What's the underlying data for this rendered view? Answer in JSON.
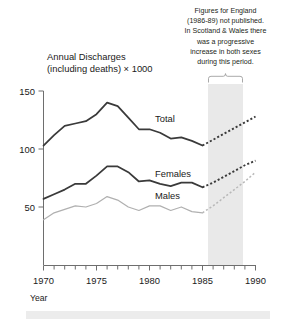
{
  "chart_data": {
    "type": "line",
    "title_line1": "Annual Discharges",
    "title_line2": "(including deaths) × 1000",
    "xlabel": "Year",
    "ylabel": "",
    "xlim": [
      1970,
      1990
    ],
    "ylim": [
      0,
      150
    ],
    "grid": false,
    "legend_position": "inline-labels",
    "x_ticks_major": [
      1970,
      1975,
      1980,
      1985,
      1990
    ],
    "x_ticks_major_labels": [
      "1970",
      "1975",
      "1980",
      "1985",
      "1990"
    ],
    "x_ticks_minor_step": 1,
    "y_ticks": [
      50,
      100,
      150
    ],
    "y_tick_labels": [
      "50",
      "100",
      "150"
    ],
    "x": [
      1970,
      1971,
      1972,
      1973,
      1974,
      1975,
      1976,
      1977,
      1978,
      1979,
      1980,
      1981,
      1982,
      1983,
      1984,
      1985,
      1986,
      1987,
      1988,
      1989,
      1990
    ],
    "series": [
      {
        "name": "Total",
        "label": "Total",
        "color": "#3a3a3a",
        "style": "solid-then-dashed",
        "dashed_from": 1985,
        "values": [
          103,
          112,
          120,
          122,
          124,
          130,
          140,
          137,
          127,
          117,
          117,
          114,
          109,
          110,
          107,
          103,
          108,
          113,
          118,
          123,
          128
        ]
      },
      {
        "name": "Females",
        "label": "Females",
        "color": "#3a3a3a",
        "style": "solid-then-dashed",
        "dashed_from": 1985,
        "values": [
          57,
          61,
          65,
          70,
          70,
          77,
          85,
          85,
          80,
          72,
          73,
          70,
          68,
          71,
          71,
          67,
          71,
          76,
          81,
          86,
          90
        ]
      },
      {
        "name": "Males",
        "label": "Males",
        "color": "#b0b0b0",
        "style": "solid-then-dashed",
        "dashed_from": 1985,
        "values": [
          39,
          45,
          48,
          51,
          50,
          53,
          59,
          56,
          50,
          47,
          51,
          51,
          47,
          50,
          46,
          45,
          51,
          58,
          65,
          72,
          80
        ]
      }
    ],
    "shaded_band": {
      "from": 1985.5,
      "to": 1989.0,
      "color": "#e9e9e9",
      "note": "Figures for England (1986-89) not published"
    },
    "annotation": {
      "lines": [
        "Figures for England",
        "(1986-89) not published.",
        "In Scotland & Wales there",
        "was a progressive",
        "increase in both sexes",
        "during this period."
      ],
      "full_text": "Figures for England (1986-89) not published. In Scotland & Wales there was a progressive increase in both sexes during this period."
    }
  }
}
